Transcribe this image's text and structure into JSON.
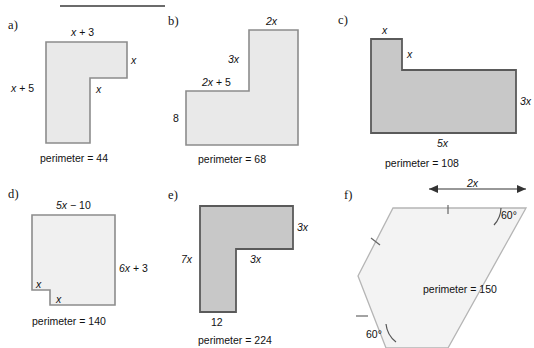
{
  "sheet": {
    "title_rule": true,
    "figure_count": 6
  },
  "colors": {
    "fill_light": "#e9e9e9",
    "fill_medium": "#c8c8c8",
    "fill_pale": "#f0f0f0",
    "stroke_light": "#8c8c8c",
    "stroke_dark": "#5a5a5a",
    "text": "#111111",
    "rule": "#6b6b6b"
  },
  "figures": [
    {
      "letter": "a)",
      "shape": "inverted-L",
      "fill": "light",
      "perimeter_label": "perimeter = 44",
      "labels": [
        {
          "text": "x + 3",
          "role": "top-width"
        },
        {
          "text": "x",
          "role": "right-upper-height"
        },
        {
          "text": "x",
          "role": "notch-width"
        },
        {
          "text": "x + 5",
          "role": "left-height"
        }
      ]
    },
    {
      "letter": "b)",
      "shape": "L-tall-right",
      "fill": "light",
      "perimeter_label": "perimeter = 68",
      "labels": [
        {
          "text": "2x",
          "role": "top-width"
        },
        {
          "text": "3x",
          "role": "inner-vertical"
        },
        {
          "text": "2x + 5",
          "role": "step-width"
        },
        {
          "text": "8",
          "role": "left-height"
        }
      ]
    },
    {
      "letter": "c)",
      "shape": "L-tall-left",
      "fill": "medium",
      "perimeter_label": "perimeter = 108",
      "labels": [
        {
          "text": "x",
          "role": "top-stem-width"
        },
        {
          "text": "x",
          "role": "stem-inner-height"
        },
        {
          "text": "3x",
          "role": "right-height"
        },
        {
          "text": "5x",
          "role": "bottom-width"
        }
      ]
    },
    {
      "letter": "d)",
      "shape": "rect-with-corner-notch",
      "fill": "pale",
      "perimeter_label": "perimeter = 140",
      "labels": [
        {
          "text": "5x − 10",
          "role": "top-width"
        },
        {
          "text": "6x + 3",
          "role": "right-height"
        },
        {
          "text": "x",
          "role": "notch-vertical"
        },
        {
          "text": "x",
          "role": "notch-horizontal"
        }
      ]
    },
    {
      "letter": "e)",
      "shape": "mirrored-L",
      "fill": "medium",
      "perimeter_label": "perimeter = 224",
      "labels": [
        {
          "text": "3x",
          "role": "right-height"
        },
        {
          "text": "3x",
          "role": "inner-horizontal"
        },
        {
          "text": "7x",
          "role": "left-height"
        },
        {
          "text": "12",
          "role": "bottom-width"
        }
      ]
    },
    {
      "letter": "f)",
      "shape": "slanted-parallelogram",
      "fill": "pale",
      "perimeter_label": "perimeter = 150",
      "labels": [
        {
          "text": "2x",
          "role": "dimension-top"
        },
        {
          "text": "60°",
          "role": "angle-top-right"
        },
        {
          "text": "60°",
          "role": "angle-bottom-left"
        }
      ]
    }
  ]
}
